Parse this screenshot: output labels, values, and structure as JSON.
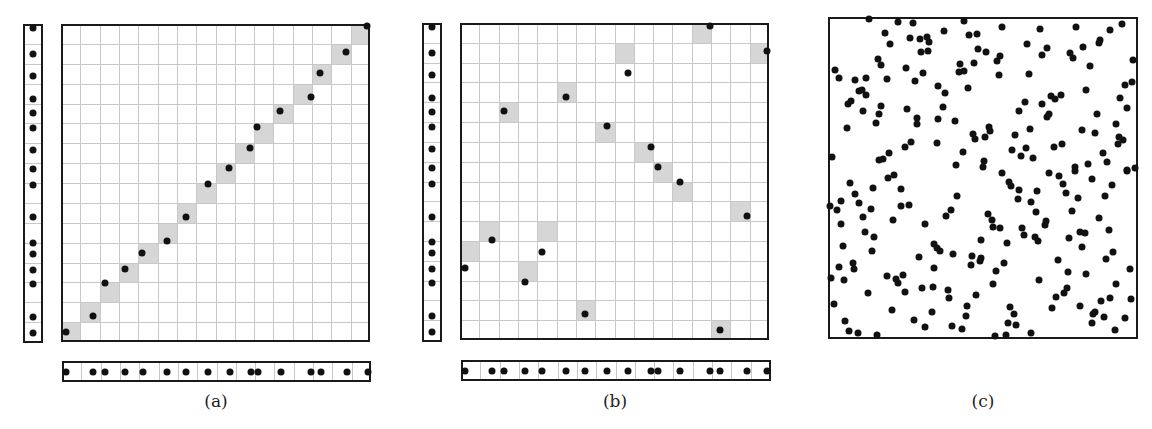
{
  "figure": {
    "panels": [
      {
        "id": "a",
        "label": "(a)"
      },
      {
        "id": "b",
        "label": "(b)"
      },
      {
        "id": "c",
        "label": "(c)"
      }
    ]
  },
  "style": {
    "dot_color": "#111111",
    "shade_color": "#d6d6d6",
    "grid_color": "#c8c8c8",
    "border_color": "#1a1a1a"
  },
  "panel_a": {
    "grid": {
      "x": 61,
      "y": 24,
      "w": 309,
      "h": 318,
      "cols": 16,
      "rows": 16
    },
    "left_strip": {
      "x": 23,
      "y": 24,
      "w": 20,
      "h": 319
    },
    "bottom_strip": {
      "x": 62,
      "y": 361,
      "w": 309,
      "h": 21
    },
    "strip_y": [
      28,
      54,
      76,
      99,
      113,
      128,
      150,
      169,
      185,
      217,
      243,
      254,
      270,
      284,
      317,
      333
    ],
    "strip_x": [
      66,
      93,
      105,
      125,
      143,
      167,
      186,
      208,
      230,
      251,
      258,
      281,
      311,
      321,
      347,
      368
    ],
    "points": [
      [
        66,
        332
      ],
      [
        93,
        316
      ],
      [
        105,
        283
      ],
      [
        125,
        269
      ],
      [
        142,
        253
      ],
      [
        167,
        241
      ],
      [
        186,
        217
      ],
      [
        208,
        184
      ],
      [
        229,
        168
      ],
      [
        250,
        148
      ],
      [
        257,
        127
      ],
      [
        280,
        111
      ],
      [
        311,
        97
      ],
      [
        320,
        73
      ],
      [
        346,
        52
      ],
      [
        367,
        26
      ]
    ],
    "shaded_cells": [
      [
        0,
        0
      ],
      [
        1,
        1
      ],
      [
        2,
        2
      ],
      [
        3,
        3
      ],
      [
        4,
        4
      ],
      [
        5,
        5
      ],
      [
        6,
        6
      ],
      [
        7,
        7
      ],
      [
        8,
        8
      ],
      [
        9,
        9
      ],
      [
        10,
        10
      ],
      [
        11,
        11
      ],
      [
        12,
        12
      ],
      [
        13,
        13
      ],
      [
        14,
        14
      ],
      [
        15,
        15
      ]
    ]
  },
  "panel_b": {
    "grid": {
      "x": 460,
      "y": 23,
      "w": 309,
      "h": 317,
      "cols": 16,
      "rows": 16
    },
    "left_strip": {
      "x": 422,
      "y": 23,
      "w": 20,
      "h": 319
    },
    "bottom_strip": {
      "x": 461,
      "y": 360,
      "w": 310,
      "h": 21
    },
    "strip_y": [
      27,
      53,
      75,
      98,
      112,
      127,
      149,
      168,
      184,
      217,
      242,
      253,
      269,
      283,
      316,
      332
    ],
    "strip_x": [
      465,
      492,
      504,
      525,
      542,
      566,
      585,
      607,
      628,
      651,
      658,
      680,
      710,
      720,
      747,
      767
    ],
    "points": [
      [
        465,
        268
      ],
      [
        492,
        240
      ],
      [
        504,
        111
      ],
      [
        525,
        282
      ],
      [
        542,
        252
      ],
      [
        566,
        97
      ],
      [
        585,
        314
      ],
      [
        607,
        126
      ],
      [
        628,
        73
      ],
      [
        651,
        147
      ],
      [
        658,
        167
      ],
      [
        680,
        182
      ],
      [
        710,
        26
      ],
      [
        720,
        330
      ],
      [
        747,
        216
      ],
      [
        767,
        51
      ]
    ],
    "shaded_cells": [
      [
        0,
        4
      ],
      [
        1,
        5
      ],
      [
        2,
        11
      ],
      [
        3,
        3
      ],
      [
        4,
        5
      ],
      [
        5,
        12
      ],
      [
        6,
        1
      ],
      [
        7,
        10
      ],
      [
        8,
        14
      ],
      [
        9,
        9
      ],
      [
        10,
        8
      ],
      [
        11,
        7
      ],
      [
        12,
        15
      ],
      [
        13,
        0
      ],
      [
        14,
        6
      ],
      [
        15,
        14
      ]
    ]
  },
  "panel_c": {
    "box": {
      "x": 828,
      "y": 17,
      "w": 310,
      "h": 322
    },
    "points": [
      [
        869,
        19
      ],
      [
        898,
        22
      ],
      [
        913,
        23
      ],
      [
        964,
        21
      ],
      [
        1002,
        27
      ],
      [
        1040,
        29
      ],
      [
        1076,
        27
      ],
      [
        1110,
        30
      ],
      [
        1122,
        24
      ],
      [
        885,
        33
      ],
      [
        890,
        44
      ],
      [
        910,
        38
      ],
      [
        920,
        39
      ],
      [
        927,
        37
      ],
      [
        929,
        42
      ],
      [
        921,
        52
      ],
      [
        928,
        51
      ],
      [
        944,
        31
      ],
      [
        969,
        35
      ],
      [
        977,
        34
      ],
      [
        978,
        49
      ],
      [
        986,
        52
      ],
      [
        974,
        63
      ],
      [
        960,
        64
      ],
      [
        959,
        72
      ],
      [
        964,
        71
      ],
      [
        968,
        88
      ],
      [
        997,
        61
      ],
      [
        1000,
        56
      ],
      [
        999,
        75
      ],
      [
        1027,
        44
      ],
      [
        1042,
        55
      ],
      [
        1047,
        48
      ],
      [
        1029,
        74
      ],
      [
        1070,
        53
      ],
      [
        1073,
        58
      ],
      [
        1083,
        47
      ],
      [
        1099,
        43
      ],
      [
        1100,
        40
      ],
      [
        1090,
        66
      ],
      [
        1133,
        60
      ],
      [
        1125,
        85
      ],
      [
        1132,
        82
      ],
      [
        1086,
        90
      ],
      [
        1120,
        98
      ],
      [
        1127,
        108
      ],
      [
        878,
        59
      ],
      [
        881,
        65
      ],
      [
        906,
        68
      ],
      [
        923,
        73
      ],
      [
        915,
        81
      ],
      [
        887,
        79
      ],
      [
        866,
        78
      ],
      [
        855,
        80
      ],
      [
        835,
        70
      ],
      [
        839,
        78
      ],
      [
        859,
        91
      ],
      [
        862,
        90
      ],
      [
        866,
        95
      ],
      [
        848,
        104
      ],
      [
        851,
        101
      ],
      [
        863,
        111
      ],
      [
        881,
        106
      ],
      [
        879,
        114
      ],
      [
        876,
        123
      ],
      [
        847,
        128
      ],
      [
        907,
        109
      ],
      [
        917,
        118
      ],
      [
        917,
        124
      ],
      [
        938,
        86
      ],
      [
        945,
        93
      ],
      [
        943,
        107
      ],
      [
        938,
        119
      ],
      [
        955,
        121
      ],
      [
        1025,
        102
      ],
      [
        1019,
        111
      ],
      [
        1042,
        104
      ],
      [
        1051,
        96
      ],
      [
        1055,
        99
      ],
      [
        1061,
        95
      ],
      [
        1049,
        114
      ],
      [
        1047,
        117
      ],
      [
        1097,
        114
      ],
      [
        1116,
        124
      ],
      [
        1030,
        129
      ],
      [
        1082,
        130
      ],
      [
        1095,
        133
      ],
      [
        1119,
        137
      ],
      [
        1123,
        140
      ],
      [
        1118,
        144
      ],
      [
        973,
        134
      ],
      [
        975,
        139
      ],
      [
        985,
        137
      ],
      [
        989,
        127
      ],
      [
        990,
        131
      ],
      [
        1015,
        135
      ],
      [
        832,
        157
      ],
      [
        879,
        160
      ],
      [
        883,
        159
      ],
      [
        889,
        153
      ],
      [
        905,
        147
      ],
      [
        911,
        142
      ],
      [
        937,
        143
      ],
      [
        963,
        152
      ],
      [
        956,
        165
      ],
      [
        984,
        161
      ],
      [
        983,
        167
      ],
      [
        1002,
        173
      ],
      [
        1012,
        150
      ],
      [
        1021,
        156
      ],
      [
        1026,
        148
      ],
      [
        1033,
        158
      ],
      [
        1054,
        147
      ],
      [
        1062,
        144
      ],
      [
        1049,
        173
      ],
      [
        1059,
        176
      ],
      [
        1075,
        167
      ],
      [
        1088,
        164
      ],
      [
        1103,
        153
      ],
      [
        1107,
        162
      ],
      [
        1127,
        170
      ],
      [
        1135,
        168
      ],
      [
        894,
        175
      ],
      [
        888,
        178
      ],
      [
        850,
        183
      ],
      [
        855,
        194
      ],
      [
        859,
        203
      ],
      [
        841,
        201
      ],
      [
        837,
        210
      ],
      [
        830,
        206
      ],
      [
        841,
        224
      ],
      [
        863,
        217
      ],
      [
        871,
        209
      ],
      [
        873,
        188
      ],
      [
        901,
        189
      ],
      [
        901,
        206
      ],
      [
        909,
        205
      ],
      [
        893,
        220
      ],
      [
        865,
        232
      ],
      [
        874,
        237
      ],
      [
        843,
        246
      ],
      [
        872,
        251
      ],
      [
        853,
        263
      ],
      [
        854,
        269
      ],
      [
        839,
        267
      ],
      [
        831,
        278
      ],
      [
        844,
        280
      ],
      [
        868,
        293
      ],
      [
        834,
        304
      ],
      [
        845,
        321
      ],
      [
        849,
        331
      ],
      [
        858,
        333
      ],
      [
        877,
        335
      ],
      [
        887,
        276
      ],
      [
        896,
        279
      ],
      [
        898,
        283
      ],
      [
        903,
        275
      ],
      [
        905,
        292
      ],
      [
        892,
        310
      ],
      [
        914,
        320
      ],
      [
        925,
        327
      ],
      [
        925,
        224
      ],
      [
        919,
        257
      ],
      [
        934,
        244
      ],
      [
        937,
        248
      ],
      [
        940,
        251
      ],
      [
        953,
        254
      ],
      [
        934,
        268
      ],
      [
        922,
        288
      ],
      [
        933,
        287
      ],
      [
        948,
        290
      ],
      [
        949,
        298
      ],
      [
        932,
        312
      ],
      [
        952,
        326
      ],
      [
        962,
        329
      ],
      [
        966,
        316
      ],
      [
        967,
        306
      ],
      [
        976,
        295
      ],
      [
        946,
        216
      ],
      [
        951,
        210
      ],
      [
        957,
        196
      ],
      [
        972,
        256
      ],
      [
        971,
        265
      ],
      [
        981,
        258
      ],
      [
        980,
        261
      ],
      [
        981,
        240
      ],
      [
        988,
        214
      ],
      [
        992,
        220
      ],
      [
        993,
        227
      ],
      [
        1000,
        228
      ],
      [
        1007,
        243
      ],
      [
        1004,
        263
      ],
      [
        996,
        271
      ],
      [
        993,
        284
      ],
      [
        1010,
        307
      ],
      [
        1014,
        314
      ],
      [
        1016,
        325
      ],
      [
        1008,
        323
      ],
      [
        1006,
        335
      ],
      [
        995,
        336
      ],
      [
        1031,
        333
      ],
      [
        1009,
        182
      ],
      [
        1011,
        186
      ],
      [
        1019,
        190
      ],
      [
        1018,
        199
      ],
      [
        1031,
        202
      ],
      [
        1037,
        191
      ],
      [
        1036,
        212
      ],
      [
        1046,
        221
      ],
      [
        1045,
        225
      ],
      [
        1022,
        228
      ],
      [
        1024,
        235
      ],
      [
        1035,
        237
      ],
      [
        1038,
        241
      ],
      [
        1039,
        280
      ],
      [
        1063,
        184
      ],
      [
        1066,
        193
      ],
      [
        1078,
        198
      ],
      [
        1072,
        211
      ],
      [
        1075,
        171
      ],
      [
        1092,
        179
      ],
      [
        1112,
        185
      ],
      [
        1105,
        196
      ],
      [
        1099,
        218
      ],
      [
        1109,
        230
      ],
      [
        1127,
        171
      ],
      [
        1080,
        232
      ],
      [
        1085,
        233
      ],
      [
        1069,
        238
      ],
      [
        1082,
        247
      ],
      [
        1058,
        260
      ],
      [
        1068,
        272
      ],
      [
        1086,
        274
      ],
      [
        1113,
        252
      ],
      [
        1106,
        259
      ],
      [
        1130,
        269
      ],
      [
        1116,
        284
      ],
      [
        1110,
        298
      ],
      [
        1101,
        301
      ],
      [
        1131,
        299
      ],
      [
        1067,
        288
      ],
      [
        1064,
        293
      ],
      [
        1056,
        297
      ],
      [
        1052,
        308
      ],
      [
        1080,
        306
      ],
      [
        1095,
        312
      ],
      [
        1093,
        314
      ],
      [
        1104,
        317
      ],
      [
        1092,
        323
      ],
      [
        1125,
        318
      ],
      [
        1115,
        330
      ]
    ]
  },
  "labels": [
    {
      "text": "(a)",
      "x": 216,
      "y": 392
    },
    {
      "text": "(b)",
      "x": 615,
      "y": 392
    },
    {
      "text": "(c)",
      "x": 983,
      "y": 392
    }
  ]
}
